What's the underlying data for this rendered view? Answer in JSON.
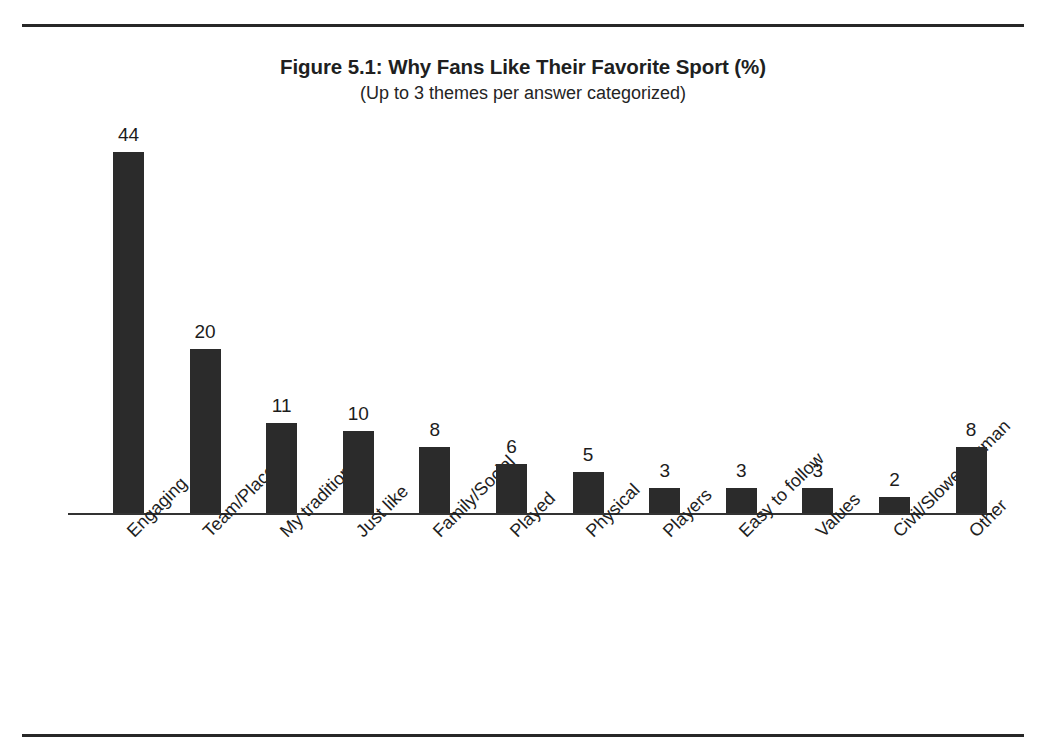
{
  "figure": {
    "title": "Figure 5.1: Why Fans Like Their Favorite Sport (%)",
    "subtitle": "(Up to 3 themes per answer categorized)"
  },
  "chart_data": {
    "type": "bar",
    "title": "Figure 5.1: Why Fans Like Their Favorite Sport (%)",
    "subtitle": "(Up to 3 themes per answer categorized)",
    "xlabel": "",
    "ylabel": "",
    "ylim": [
      0,
      44
    ],
    "grid": false,
    "legend": null,
    "axis_visible": {
      "x_baseline": true,
      "y_axis": false,
      "y_ticks": false
    },
    "value_labels_shown": true,
    "bar_color": "#2b2b2b",
    "categories": [
      "Engaging",
      "Team/Place",
      "My tradition",
      "Just like",
      "Family/Social",
      "Played",
      "Physical",
      "Players",
      "Easy to follow",
      "Values",
      "Civil/Slower/Human",
      "Other"
    ],
    "values": [
      44,
      20,
      11,
      10,
      8,
      6,
      5,
      3,
      3,
      3,
      2,
      8
    ]
  },
  "page": {
    "rule_color": "#272727"
  }
}
